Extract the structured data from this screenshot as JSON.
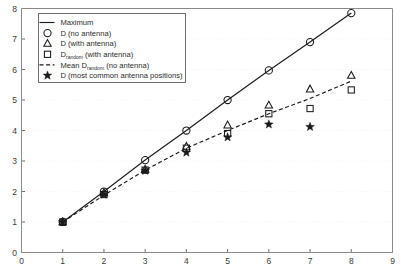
{
  "chart_data": {
    "type": "scatter",
    "title": "",
    "xlabel": "",
    "ylabel": "",
    "xlim": [
      0,
      9
    ],
    "ylim": [
      0,
      8
    ],
    "xticks": [
      "0",
      "1",
      "2",
      "3",
      "4",
      "5",
      "6",
      "7",
      "8",
      "9"
    ],
    "yticks": [
      "0",
      "1",
      "2",
      "3",
      "4",
      "5",
      "6",
      "7",
      "8"
    ],
    "grid": true,
    "legend_position": "upper-left",
    "x": [
      1,
      2,
      3,
      4,
      5,
      6,
      7,
      8
    ],
    "series": [
      {
        "name": "Maximum",
        "marker": "none",
        "line": "solid",
        "values": [
          1.0,
          2.0,
          3.03,
          4.0,
          5.0,
          5.97,
          6.9,
          7.85
        ]
      },
      {
        "name": "D (no antenna)",
        "marker": "circle",
        "line": "none",
        "values": [
          1.0,
          2.0,
          3.03,
          4.0,
          5.0,
          5.97,
          6.9,
          7.85
        ]
      },
      {
        "name": "D (with antenna)",
        "marker": "triangle",
        "line": "none",
        "values": [
          1.0,
          1.95,
          2.72,
          3.47,
          4.17,
          4.82,
          5.35,
          5.8
        ]
      },
      {
        "name": "D_random (with antenna)",
        "marker": "square",
        "line": "none",
        "values": [
          1.0,
          1.9,
          2.7,
          3.42,
          3.9,
          4.55,
          4.72,
          5.33
        ]
      },
      {
        "name": "Mean D_random (no antenna)",
        "marker": "none",
        "line": "dashed",
        "values": [
          1.0,
          1.88,
          2.7,
          3.42,
          4.0,
          4.55,
          5.05,
          5.62
        ]
      },
      {
        "name": "D (most common antenna positions)",
        "marker": "star",
        "line": "none",
        "values": [
          1.0,
          1.9,
          2.68,
          3.28,
          3.78,
          4.2,
          4.12,
          null
        ]
      }
    ],
    "legend": [
      {
        "label": "Maximum",
        "label_sub": "",
        "label_tail": "",
        "sample": "solid-line"
      },
      {
        "label": "D (no antenna)",
        "label_sub": "",
        "label_tail": "",
        "sample": "circle-marker"
      },
      {
        "label": "D (with antenna)",
        "label_sub": "",
        "label_tail": "",
        "sample": "triangle-marker"
      },
      {
        "label": "D",
        "label_sub": "random",
        "label_tail": "(with antenna)",
        "sample": "square-marker"
      },
      {
        "label": "Mean D",
        "label_sub": "random",
        "label_tail": "(no antenna)",
        "sample": "dashed-line"
      },
      {
        "label": "D (most common antenna positions)",
        "label_sub": "",
        "label_tail": "",
        "sample": "star-marker"
      }
    ]
  },
  "colors": {
    "ink": "#1a1a1a",
    "axis": "#8a8a8a",
    "grid": "#f2f2f4",
    "background": "#ffffff"
  }
}
